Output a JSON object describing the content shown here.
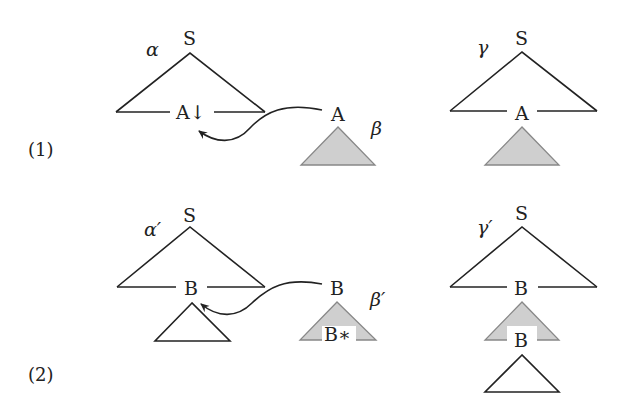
{
  "figure": {
    "rows": [
      {
        "number": "(1)",
        "operation": "substitution",
        "left_tree": {
          "name": "α",
          "root": "S",
          "frontier_node": "A↓"
        },
        "aux_tree": {
          "name": "β",
          "root": "A"
        },
        "result_tree": {
          "name": "γ",
          "root": "S",
          "frontier_node": "A"
        }
      },
      {
        "number": "(2)",
        "operation": "adjunction",
        "left_tree": {
          "name": "α′",
          "root": "S",
          "frontier_node": "B"
        },
        "aux_tree": {
          "name": "β′",
          "root": "B",
          "foot": "B∗"
        },
        "result_tree": {
          "name": "γ′",
          "root": "S",
          "frontier_node": "B",
          "foot": "B"
        }
      }
    ],
    "colors": {
      "line": "#222222",
      "shaded_fill": "#cfcfcf",
      "background": "#ffffff"
    }
  }
}
